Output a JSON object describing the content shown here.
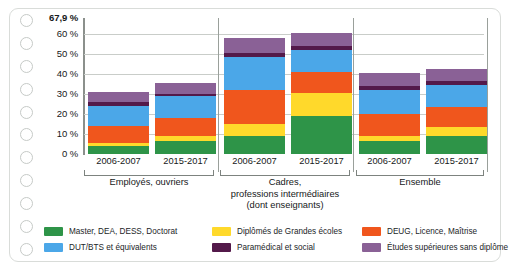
{
  "card": {
    "hole_count": 11,
    "hole_icon": "punch-hole-circle"
  },
  "chart_data": {
    "type": "bar",
    "stacked": true,
    "title": "",
    "subtitle": "",
    "xlabel": "",
    "ylabel": "",
    "ylim": [
      0,
      67.9
    ],
    "grid": true,
    "legend_position": "bottom",
    "axis": {
      "yticks": [
        "0 %",
        "10 %",
        "20 %",
        "30 %",
        "40 %",
        "50 %",
        "60 %",
        "67,9 %"
      ],
      "ytick_values": [
        0,
        10,
        20,
        30,
        40,
        50,
        60,
        67.9
      ],
      "top_label": "67,9 %"
    },
    "categories": [
      "2006-2007",
      "2015-2017",
      "2006-2007",
      "2015-2017",
      "2006-2007",
      "2015-2017"
    ],
    "groups": [
      {
        "label": "Employés, ouvriers",
        "periods": [
          "2006-2007",
          "2015-2017"
        ]
      },
      {
        "label": "Cadres,\nprofessions intermédiaires\n(dont enseignants)",
        "periods": [
          "2006-2007",
          "2015-2017"
        ]
      },
      {
        "label": "Ensemble",
        "periods": [
          "2006-2007",
          "2015-2017"
        ]
      }
    ],
    "series": [
      {
        "name": "Master, DEA, DESS, Doctorat",
        "color": "#2e9448",
        "values": [
          4.0,
          6.5,
          9.0,
          19.0,
          6.5,
          9.0
        ]
      },
      {
        "name": "Diplômés de Grandes écoles",
        "color": "#ffd92b",
        "values": [
          1.5,
          2.5,
          6.0,
          11.5,
          2.5,
          4.5
        ]
      },
      {
        "name": "DEUG, Licence, Maîtrise",
        "color": "#f0561d",
        "values": [
          8.5,
          9.0,
          17.0,
          10.5,
          11.0,
          10.0
        ]
      },
      {
        "name": "DUT/BTS et équivalents",
        "color": "#4ba7e8",
        "values": [
          10.0,
          11.0,
          16.5,
          11.0,
          12.0,
          11.0
        ]
      },
      {
        "name": "Paramédical et social",
        "color": "#53194a",
        "values": [
          2.0,
          1.0,
          2.0,
          2.0,
          2.0,
          2.0
        ]
      },
      {
        "name": "Études supérieures sans diplôme",
        "color": "#8a6196",
        "values": [
          5.0,
          5.5,
          7.5,
          6.5,
          6.5,
          6.0
        ]
      }
    ],
    "totals": [
      31.0,
      35.5,
      58.0,
      60.5,
      40.5,
      42.5
    ],
    "colors": {
      "master": "#2e9448",
      "grandes_ecoles": "#ffd92b",
      "deug_licence": "#f0561d",
      "dut_bts": "#4ba7e8",
      "paramedical": "#53194a",
      "sans_diplome": "#8a6196",
      "grid": "#c9cdc9",
      "axis": "#8b908c",
      "text": "#16191a",
      "frame": "#d9dcd9"
    }
  }
}
